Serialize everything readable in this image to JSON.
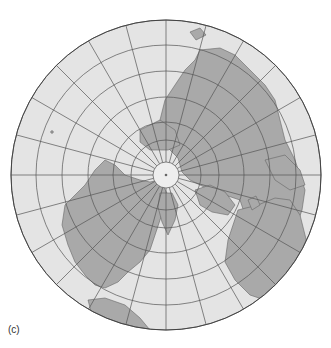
{
  "figure": {
    "label": "(c)",
    "projection": "polar azimuthal (north pole centered)",
    "center": [
      166,
      175
    ],
    "radius": 155,
    "pole_cap_radius": 13,
    "parallel_radii": [
      35,
      53,
      78,
      104,
      130,
      155
    ],
    "meridian_step_deg": 15,
    "colors": {
      "ocean": "#e4e4e4",
      "land": "#a9a9a9",
      "grid": "#555555",
      "coast": "#666666",
      "pole_cap": "#eeeeee"
    }
  }
}
